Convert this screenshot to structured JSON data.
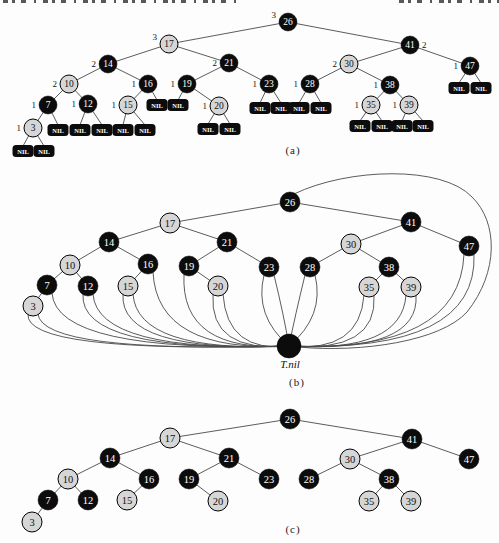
{
  "captions": {
    "a": "(a)",
    "b": "(b)",
    "c": "(c)"
  },
  "tnil_label": "T.nil",
  "nil_text": "NIL",
  "colors": {
    "background": "#fdfdfd",
    "black_node_fill": "#0c0c0c",
    "red_node_fill": "#d6d6d6",
    "node_stroke": "#000000",
    "edge_stroke": "#4a4a4a",
    "text_on_black": "#ffffff",
    "text_on_red": "#111111",
    "bh_label_color": "#111111",
    "nil_text_color": "#ffffff"
  },
  "node_colors": {
    "26": "black",
    "17": "red",
    "41": "black",
    "14": "black",
    "21": "black",
    "30": "red",
    "47": "black",
    "10": "red",
    "16": "black",
    "19": "black",
    "23": "black",
    "28": "black",
    "38": "black",
    "7": "black",
    "12": "black",
    "15": "red",
    "20": "red",
    "35": "red",
    "39": "red",
    "3": "red"
  },
  "tree_edges": [
    [
      "26",
      "17"
    ],
    [
      "26",
      "41"
    ],
    [
      "17",
      "14"
    ],
    [
      "17",
      "21"
    ],
    [
      "41",
      "30"
    ],
    [
      "41",
      "47"
    ],
    [
      "14",
      "10"
    ],
    [
      "14",
      "16"
    ],
    [
      "21",
      "19"
    ],
    [
      "21",
      "23"
    ],
    [
      "30",
      "28"
    ],
    [
      "30",
      "38"
    ],
    [
      "10",
      "7"
    ],
    [
      "10",
      "12"
    ],
    [
      "16",
      "15"
    ],
    [
      "19",
      "20"
    ],
    [
      "7",
      "3"
    ],
    [
      "38",
      "35"
    ],
    [
      "38",
      "39"
    ]
  ],
  "figures": {
    "a": {
      "node_radius": 9,
      "font_size": 9.5,
      "nodes": [
        {
          "key": "26",
          "x": 288,
          "y": 22,
          "bh": "3",
          "bh_dy": -4
        },
        {
          "key": "17",
          "x": 169,
          "y": 44,
          "bh": "3",
          "bh_dy": -4
        },
        {
          "key": "41",
          "x": 410,
          "y": 45,
          "bh": "2",
          "bh_side": "right"
        },
        {
          "key": "14",
          "x": 108,
          "y": 64,
          "bh": "2"
        },
        {
          "key": "21",
          "x": 229,
          "y": 63,
          "bh": "2"
        },
        {
          "key": "30",
          "x": 349,
          "y": 64,
          "bh": "2"
        },
        {
          "key": "47",
          "x": 470,
          "y": 66,
          "bh": "1"
        },
        {
          "key": "10",
          "x": 69,
          "y": 84,
          "bh": "2"
        },
        {
          "key": "16",
          "x": 148,
          "y": 84,
          "bh": "1"
        },
        {
          "key": "19",
          "x": 187,
          "y": 84,
          "bh": "1"
        },
        {
          "key": "23",
          "x": 269,
          "y": 84,
          "bh": "1"
        },
        {
          "key": "28",
          "x": 310,
          "y": 84,
          "bh": "1"
        },
        {
          "key": "38",
          "x": 390,
          "y": 85,
          "bh": "1"
        },
        {
          "key": "7",
          "x": 48,
          "y": 105,
          "bh": "1"
        },
        {
          "key": "12",
          "x": 88,
          "y": 104,
          "bh": "1"
        },
        {
          "key": "15",
          "x": 128,
          "y": 105,
          "bh": "1"
        },
        {
          "key": "20",
          "x": 219,
          "y": 106,
          "bh": "1"
        },
        {
          "key": "35",
          "x": 371,
          "y": 105,
          "bh": "1"
        },
        {
          "key": "39",
          "x": 409,
          "y": 105,
          "bh": "1"
        },
        {
          "key": "3",
          "x": 33,
          "y": 128,
          "bh": "1"
        }
      ],
      "nil_nodes": [
        {
          "parent": "3",
          "x": 23,
          "y": 151
        },
        {
          "parent": "3",
          "x": 44,
          "y": 151
        },
        {
          "parent": "7",
          "x": 58,
          "y": 130
        },
        {
          "parent": "12",
          "x": 80,
          "y": 130
        },
        {
          "parent": "12",
          "x": 102,
          "y": 130
        },
        {
          "parent": "15",
          "x": 123,
          "y": 130
        },
        {
          "parent": "15",
          "x": 145,
          "y": 130
        },
        {
          "parent": "16",
          "x": 157,
          "y": 105
        },
        {
          "parent": "19",
          "x": 178,
          "y": 105
        },
        {
          "parent": "20",
          "x": 208,
          "y": 129
        },
        {
          "parent": "20",
          "x": 230,
          "y": 129
        },
        {
          "parent": "23",
          "x": 260,
          "y": 108
        },
        {
          "parent": "23",
          "x": 281,
          "y": 108
        },
        {
          "parent": "28",
          "x": 299,
          "y": 108
        },
        {
          "parent": "28",
          "x": 321,
          "y": 108
        },
        {
          "parent": "35",
          "x": 360,
          "y": 126
        },
        {
          "parent": "35",
          "x": 382,
          "y": 126
        },
        {
          "parent": "39",
          "x": 402,
          "y": 126
        },
        {
          "parent": "39",
          "x": 423,
          "y": 126
        },
        {
          "parent": "47",
          "x": 459,
          "y": 88
        },
        {
          "parent": "47",
          "x": 481,
          "y": 88
        }
      ]
    },
    "b": {
      "node_radius": 10,
      "font_size": 10.5,
      "nodes": [
        {
          "key": "26",
          "x": 290,
          "y": 202
        },
        {
          "key": "17",
          "x": 170,
          "y": 223
        },
        {
          "key": "41",
          "x": 411,
          "y": 222
        },
        {
          "key": "14",
          "x": 109,
          "y": 242
        },
        {
          "key": "21",
          "x": 227,
          "y": 242
        },
        {
          "key": "30",
          "x": 351,
          "y": 244
        },
        {
          "key": "47",
          "x": 469,
          "y": 246
        },
        {
          "key": "10",
          "x": 70,
          "y": 265
        },
        {
          "key": "16",
          "x": 148,
          "y": 264
        },
        {
          "key": "19",
          "x": 189,
          "y": 266
        },
        {
          "key": "23",
          "x": 269,
          "y": 267
        },
        {
          "key": "28",
          "x": 310,
          "y": 267
        },
        {
          "key": "38",
          "x": 389,
          "y": 267
        },
        {
          "key": "7",
          "x": 47,
          "y": 285
        },
        {
          "key": "12",
          "x": 88,
          "y": 286
        },
        {
          "key": "15",
          "x": 128,
          "y": 286
        },
        {
          "key": "20",
          "x": 218,
          "y": 286
        },
        {
          "key": "35",
          "x": 369,
          "y": 287
        },
        {
          "key": "39",
          "x": 411,
          "y": 287
        },
        {
          "key": "3",
          "x": 33,
          "y": 306
        }
      ],
      "tnil": {
        "x": 289,
        "y": 346,
        "r": 12
      },
      "nil_curves": [
        {
          "node": "3",
          "side": "L"
        },
        {
          "node": "3",
          "side": "R"
        },
        {
          "node": "7",
          "side": "R"
        },
        {
          "node": "12",
          "side": "L"
        },
        {
          "node": "12",
          "side": "R"
        },
        {
          "node": "15",
          "side": "L"
        },
        {
          "node": "15",
          "side": "R"
        },
        {
          "node": "16",
          "side": "R"
        },
        {
          "node": "19",
          "side": "L"
        },
        {
          "node": "20",
          "side": "L"
        },
        {
          "node": "20",
          "side": "R"
        },
        {
          "node": "23",
          "side": "L"
        },
        {
          "node": "23",
          "side": "R"
        },
        {
          "node": "28",
          "side": "L"
        },
        {
          "node": "28",
          "side": "R"
        },
        {
          "node": "35",
          "side": "L"
        },
        {
          "node": "35",
          "side": "R"
        },
        {
          "node": "39",
          "side": "L"
        },
        {
          "node": "39",
          "side": "R"
        },
        {
          "node": "47",
          "side": "L"
        },
        {
          "node": "47",
          "side": "R"
        }
      ]
    },
    "c": {
      "node_radius": 10,
      "font_size": 10.5,
      "nodes": [
        {
          "key": "26",
          "x": 290,
          "y": 419
        },
        {
          "key": "17",
          "x": 170,
          "y": 438
        },
        {
          "key": "41",
          "x": 412,
          "y": 439
        },
        {
          "key": "14",
          "x": 110,
          "y": 458
        },
        {
          "key": "21",
          "x": 229,
          "y": 458
        },
        {
          "key": "30",
          "x": 350,
          "y": 459
        },
        {
          "key": "47",
          "x": 469,
          "y": 459
        },
        {
          "key": "10",
          "x": 68,
          "y": 479
        },
        {
          "key": "16",
          "x": 149,
          "y": 479
        },
        {
          "key": "19",
          "x": 189,
          "y": 479
        },
        {
          "key": "23",
          "x": 269,
          "y": 479
        },
        {
          "key": "28",
          "x": 309,
          "y": 479
        },
        {
          "key": "38",
          "x": 389,
          "y": 479
        },
        {
          "key": "7",
          "x": 48,
          "y": 500
        },
        {
          "key": "12",
          "x": 88,
          "y": 500
        },
        {
          "key": "15",
          "x": 127,
          "y": 500
        },
        {
          "key": "20",
          "x": 218,
          "y": 501
        },
        {
          "key": "35",
          "x": 369,
          "y": 501
        },
        {
          "key": "39",
          "x": 411,
          "y": 501
        },
        {
          "key": "3",
          "x": 32,
          "y": 522
        }
      ]
    }
  }
}
